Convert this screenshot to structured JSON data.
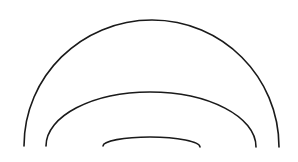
{
  "diagram": {
    "background": "#ffffff",
    "stroke_color": "#1a1a1a",
    "stroke_width": 1.6,
    "arcs": [
      {
        "name": "outer-arc",
        "start": [
          24,
          146
        ],
        "control_top": [
          152,
          20
        ],
        "end": [
          279,
          147
        ]
      },
      {
        "name": "middle-arc",
        "start": [
          46,
          146
        ],
        "control_top": [
          150,
          92
        ],
        "end": [
          256,
          147
        ]
      },
      {
        "name": "inner-arc",
        "start": [
          103,
          146
        ],
        "control_top": [
          150,
          137
        ],
        "end": [
          200,
          147
        ]
      }
    ]
  }
}
